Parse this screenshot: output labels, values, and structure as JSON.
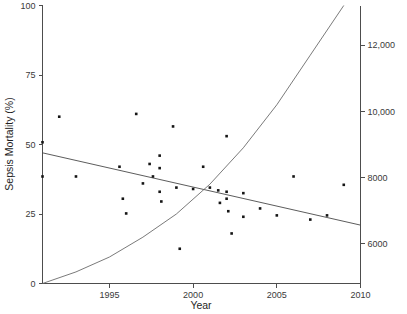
{
  "chart_data": {
    "type": "scatter",
    "title": "",
    "subtitle": "",
    "xlabel": "Year",
    "ylabel": "Sepsis Mortality (%)",
    "y2label": "",
    "xlim": [
      1991,
      2010
    ],
    "ylim": [
      0,
      100
    ],
    "y2lim": [
      4800,
      13200
    ],
    "grid": false,
    "legend": null,
    "xticks": [
      1995,
      2000,
      2005,
      2010
    ],
    "xtick_labels": [
      "1995",
      "2000",
      "2005",
      "2010"
    ],
    "yticks": [
      0,
      25,
      50,
      75,
      100
    ],
    "ytick_labels": [
      "0",
      "25",
      "50",
      "75",
      "100"
    ],
    "y2ticks": [
      6000,
      8000,
      10000,
      12000
    ],
    "y2tick_labels": [
      "6000",
      "8000",
      "10,000",
      "12,000"
    ],
    "series": [
      {
        "name": "Sepsis Mortality (%)",
        "type": "scatter",
        "axis": "left",
        "points": [
          [
            1991,
            50.8
          ],
          [
            1991,
            38.5
          ],
          [
            1992,
            60.0
          ],
          [
            1993,
            38.5
          ],
          [
            1995.6,
            42.0
          ],
          [
            1995.8,
            30.5
          ],
          [
            1996,
            25.2
          ],
          [
            1996.6,
            61.0
          ],
          [
            1997,
            36.0
          ],
          [
            1997.4,
            43.0
          ],
          [
            1997.6,
            38.5
          ],
          [
            1998,
            46.0
          ],
          [
            1998,
            41.5
          ],
          [
            1998,
            33.0
          ],
          [
            1998.1,
            29.5
          ],
          [
            1998.8,
            56.5
          ],
          [
            1999,
            34.5
          ],
          [
            1999.2,
            12.5
          ],
          [
            2000,
            34.0
          ],
          [
            2000.6,
            42.0
          ],
          [
            2001,
            34.5
          ],
          [
            2001.5,
            33.5
          ],
          [
            2001.6,
            29.0
          ],
          [
            2002,
            53.0
          ],
          [
            2002,
            33.0
          ],
          [
            2002,
            30.5
          ],
          [
            2002.1,
            26.0
          ],
          [
            2002.3,
            18.0
          ],
          [
            2003,
            32.5
          ],
          [
            2003,
            24.0
          ],
          [
            2004,
            27.0
          ],
          [
            2005,
            24.5
          ],
          [
            2006,
            38.5
          ],
          [
            2007,
            23.0
          ],
          [
            2008,
            24.5
          ],
          [
            2009,
            35.5
          ]
        ]
      },
      {
        "name": "Mortality trend (linear fit)",
        "type": "line",
        "axis": "left",
        "points": [
          [
            1991,
            47.0
          ],
          [
            2010,
            21.0
          ]
        ]
      },
      {
        "name": "Sepsis cases (exponential rise)",
        "type": "line",
        "axis": "right",
        "points": [
          [
            1991,
            4800
          ],
          [
            1993,
            5150
          ],
          [
            1995,
            5600
          ],
          [
            1997,
            6200
          ],
          [
            1999,
            6900
          ],
          [
            2001,
            7800
          ],
          [
            2003,
            8900
          ],
          [
            2005,
            10200
          ],
          [
            2007,
            11700
          ],
          [
            2009,
            13200
          ]
        ]
      }
    ]
  },
  "figure": {
    "background_color": "#ffffff",
    "point_color": "#151515",
    "line_color": "#4a4a4a",
    "curve_color": "#6b6b6b",
    "axis_color": "#4d4d4d"
  }
}
